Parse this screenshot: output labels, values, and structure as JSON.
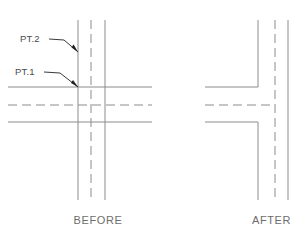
{
  "diagram": {
    "stroke_color": "#8c8c8c",
    "centerline_color": "#8c8c8c",
    "leader_color": "#3a3a3a",
    "text_color": "#6d6d6d",
    "background": "#ffffff"
  },
  "annotations": [
    {
      "id": "pt2",
      "label": "PT.2",
      "text_x": 20,
      "text_y": 42,
      "leader": "M 49,39 L 64,40 L 78,52",
      "arrow_tip_x": 78,
      "arrow_tip_y": 52
    },
    {
      "id": "pt1",
      "label": "PT.1",
      "text_x": 15,
      "text_y": 75,
      "leader": "M 44,72 L 60,73 L 78,87",
      "arrow_tip_x": 78,
      "arrow_tip_y": 87
    }
  ],
  "panels": [
    {
      "id": "before",
      "caption": "BEFORE",
      "caption_x": 98,
      "caption_y": 224,
      "description": "Two crossing roadways drawn as full solid edge lines with dashed centerlines passing straight through the intersection; nothing is trimmed.",
      "horizontal_lines": [
        {
          "kind": "solid",
          "x1": 8,
          "y1": 87,
          "x2": 152,
          "y2": 87
        },
        {
          "kind": "dashed",
          "x1": 8,
          "y1": 105,
          "x2": 152,
          "y2": 105
        },
        {
          "kind": "solid",
          "x1": 8,
          "y1": 122,
          "x2": 152,
          "y2": 122
        }
      ],
      "vertical_lines": [
        {
          "kind": "solid",
          "x1": 78,
          "y1": 20,
          "x2": 78,
          "y2": 200
        },
        {
          "kind": "dashed",
          "x1": 91,
          "y1": 20,
          "x2": 91,
          "y2": 200
        },
        {
          "kind": "solid",
          "x1": 105,
          "y1": 20,
          "x2": 105,
          "y2": 200
        }
      ]
    },
    {
      "id": "after",
      "caption": "AFTER",
      "caption_x": 252,
      "caption_y": 224,
      "description": "The same intersection after trimming: the horizontal edge lines stop and turn into the vertical edge line, the vertical edge line is broken open across the opening, and the centerlines meet in a tee.",
      "trimmed_edges": [
        {
          "kind": "solid",
          "path": "M 205,87 L 258,87 L 258,20"
        },
        {
          "kind": "solid",
          "path": "M 205,122 L 258,122 L 258,200"
        }
      ],
      "horizontal_lines": [
        {
          "kind": "dashed",
          "x1": 205,
          "y1": 105,
          "x2": 275,
          "y2": 105
        }
      ],
      "vertical_lines": [
        {
          "kind": "dashed",
          "x1": 275,
          "y1": 20,
          "x2": 275,
          "y2": 200
        },
        {
          "kind": "solid",
          "x1": 288,
          "y1": 20,
          "x2": 288,
          "y2": 200
        }
      ]
    }
  ]
}
